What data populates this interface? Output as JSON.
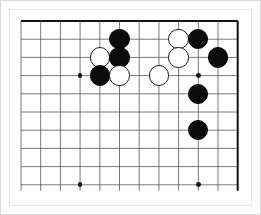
{
  "app": {
    "title": "Go Board Position",
    "board_background": "#ffffff",
    "line_color": "#555555",
    "edge_line_color": "#111111",
    "black_stone_color": "#0b0b0b",
    "white_stone_color": "#ffffff",
    "white_stone_border_color": "#1a1a1a"
  },
  "board": {
    "view_label": "Go board partial view",
    "columns": 12,
    "rows": 10,
    "origin_x": 11,
    "origin_y": 11,
    "col_spacing": 19.7,
    "row_spacing": 18.2,
    "right_edge_is_board_border": true,
    "right_edge_col_index": 11,
    "stone_radius": 10.2,
    "hoshi_radius": 2.4
  },
  "hoshi_points": [
    {
      "name": "hoshi-left",
      "col": 3,
      "row": 3
    },
    {
      "name": "hoshi-right",
      "col": 9,
      "row": 3
    },
    {
      "name": "hoshi-bottom-left",
      "col": 3,
      "row": 9
    },
    {
      "name": "hoshi-bottom-right",
      "col": 9,
      "row": 9
    }
  ],
  "stones": [
    {
      "name": "stone-black-1",
      "color": "black",
      "col": 5,
      "row": 1,
      "label": "Black stone"
    },
    {
      "name": "stone-white-1",
      "color": "white",
      "col": 4,
      "row": 2,
      "label": "White stone"
    },
    {
      "name": "stone-black-2",
      "color": "black",
      "col": 5,
      "row": 2,
      "label": "Black stone"
    },
    {
      "name": "stone-black-3",
      "color": "black",
      "col": 4,
      "row": 3,
      "label": "Black stone"
    },
    {
      "name": "stone-white-2",
      "color": "white",
      "col": 5,
      "row": 3,
      "label": "White stone"
    },
    {
      "name": "stone-white-3",
      "color": "white",
      "col": 7,
      "row": 3,
      "label": "White stone"
    },
    {
      "name": "stone-white-4",
      "color": "white",
      "col": 8,
      "row": 1,
      "label": "White stone"
    },
    {
      "name": "stone-black-4",
      "color": "black",
      "col": 9,
      "row": 1,
      "label": "Black stone"
    },
    {
      "name": "stone-white-5",
      "color": "white",
      "col": 8,
      "row": 2,
      "label": "White stone"
    },
    {
      "name": "stone-black-5",
      "color": "black",
      "col": 10,
      "row": 2,
      "label": "Black stone"
    },
    {
      "name": "stone-black-6",
      "color": "black",
      "col": 9,
      "row": 4,
      "label": "Black stone"
    },
    {
      "name": "stone-black-7",
      "color": "black",
      "col": 9,
      "row": 6,
      "label": "Black stone"
    }
  ]
}
